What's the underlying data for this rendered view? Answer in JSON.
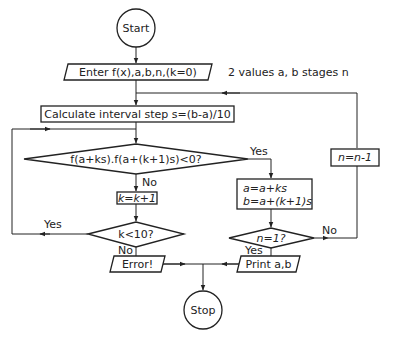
{
  "diagram": {
    "nodes": {
      "start": {
        "label": "Start",
        "shape": "terminal"
      },
      "enter": {
        "label": "Enter f(x),a,b,n,(k=0)",
        "shape": "io"
      },
      "enter_note": {
        "label": "2 values a, b  stages n",
        "shape": "annotation"
      },
      "calc": {
        "label": "Calculate interval step s=(b-a)/10",
        "shape": "process"
      },
      "test_sign": {
        "label": "f(a+ks).f(a+(k+1)s)<0?",
        "shape": "decision"
      },
      "inc_k": {
        "label": "k=k+1",
        "shape": "process"
      },
      "update_ab": {
        "line1": "a=a+ks",
        "line2": "b=a+(k+1)s",
        "shape": "process"
      },
      "dec_n": {
        "label": "n=n-1",
        "shape": "process"
      },
      "test_k": {
        "label": "k<10?",
        "shape": "decision"
      },
      "test_n": {
        "label": "n=1?",
        "shape": "decision"
      },
      "error": {
        "label": "Error!",
        "shape": "io"
      },
      "print": {
        "label": "Print a,b",
        "shape": "io"
      },
      "stop": {
        "label": "Stop",
        "shape": "terminal"
      }
    },
    "edge_labels": {
      "test_sign_yes": "Yes",
      "test_sign_no": "No",
      "test_k_yes": "Yes",
      "test_k_no": "No",
      "test_n_yes": "Yes",
      "test_n_no": "No"
    },
    "edges": [
      {
        "from": "start",
        "to": "enter"
      },
      {
        "from": "enter",
        "to": "calc"
      },
      {
        "from": "calc",
        "to": "test_sign"
      },
      {
        "from": "test_sign",
        "to": "inc_k",
        "label": "No"
      },
      {
        "from": "test_sign",
        "to": "update_ab",
        "label": "Yes"
      },
      {
        "from": "inc_k",
        "to": "test_k"
      },
      {
        "from": "test_k",
        "to": "test_sign",
        "label": "Yes"
      },
      {
        "from": "test_k",
        "to": "error",
        "label": "No"
      },
      {
        "from": "update_ab",
        "to": "test_n"
      },
      {
        "from": "test_n",
        "to": "print",
        "label": "Yes"
      },
      {
        "from": "test_n",
        "to": "dec_n",
        "label": "No"
      },
      {
        "from": "dec_n",
        "to": "calc"
      },
      {
        "from": "error",
        "to": "stop"
      },
      {
        "from": "print",
        "to": "stop"
      }
    ]
  }
}
